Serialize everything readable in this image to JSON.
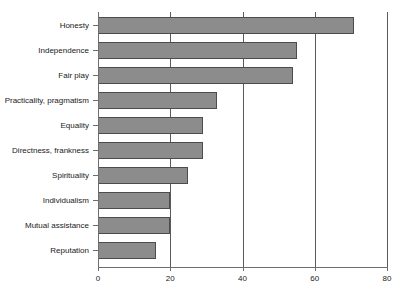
{
  "chart_data": {
    "type": "bar",
    "orientation": "horizontal",
    "title": "",
    "subtitle": "",
    "xlabel": "",
    "ylabel": "",
    "xlim": [
      0,
      80
    ],
    "xticks": [
      0,
      20,
      40,
      60,
      80
    ],
    "grid": "vertical",
    "legend": "none",
    "categories": [
      "Honesty",
      "Independence",
      "Fair play",
      "Practicality, pragmatism",
      "Equality",
      "Directness, frankness",
      "Spirituality",
      "Individualism",
      "Mutual assistance",
      "Reputation"
    ],
    "values": [
      71,
      55,
      54,
      33,
      29,
      29,
      25,
      20,
      20,
      16
    ],
    "bar_color": "#8c8c8c",
    "bar_edge_color": "#4c4c4c",
    "axis_color": "#6e6e6e",
    "grid_color": "#5a5a5a",
    "background": "#ffffff"
  }
}
